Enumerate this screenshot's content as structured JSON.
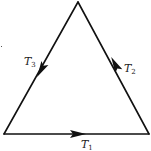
{
  "diagram": {
    "type": "triangle-circuit",
    "vertices": {
      "top": [
        78,
        2
      ],
      "bottom_left": [
        4,
        134
      ],
      "bottom_right": [
        149,
        134
      ]
    },
    "edges": [
      {
        "id": "T1",
        "label_main": "T",
        "label_sub": "1",
        "from": "bottom_left",
        "to": "bottom_right",
        "arrow_direction": "right"
      },
      {
        "id": "T2",
        "label_main": "T",
        "label_sub": "2",
        "from": "bottom_right",
        "to": "top",
        "arrow_direction": "up-left"
      },
      {
        "id": "T3",
        "label_main": "T",
        "label_sub": "3",
        "from": "top",
        "to": "bottom_left",
        "arrow_direction": "down-left"
      }
    ],
    "colors": {
      "stroke": "#111111",
      "background": "#ffffff"
    }
  }
}
